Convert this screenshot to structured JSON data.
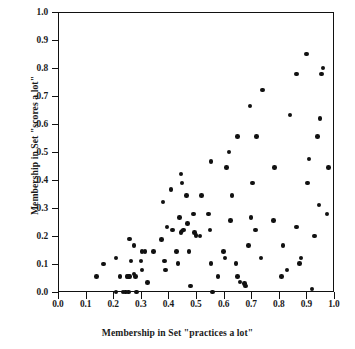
{
  "chart_data": {
    "type": "scatter",
    "title": "",
    "xlabel": "Membership in Set \"practices a lot\"",
    "ylabel": "Membership in Set \"scores a lot\"",
    "xlim": [
      0.0,
      1.0
    ],
    "ylim": [
      0.0,
      1.0
    ],
    "grid": false,
    "legend": null,
    "marker": {
      "shape": "circle",
      "color": "#111111",
      "size": 4.6
    },
    "xticks": [
      "0.0",
      "0.1",
      "0.2",
      "0.3",
      "0.4",
      "0.5",
      "0.6",
      "0.7",
      "0.8",
      "0.9",
      "1.0"
    ],
    "yticks": [
      "0.0",
      "0.1",
      "0.2",
      "0.3",
      "0.4",
      "0.5",
      "0.6",
      "0.7",
      "0.8",
      "0.9",
      "1.0"
    ],
    "xtick_values": [
      0.0,
      0.1,
      0.2,
      0.3,
      0.4,
      0.5,
      0.6,
      0.7,
      0.8,
      0.9,
      1.0
    ],
    "ytick_values": [
      0.0,
      0.1,
      0.2,
      0.3,
      0.4,
      0.5,
      0.6,
      0.7,
      0.8,
      0.9,
      1.0
    ],
    "n_points": 108,
    "points": [
      [
        0.14,
        0.055
      ],
      [
        0.165,
        0.1
      ],
      [
        0.21,
        0.0
      ],
      [
        0.21,
        0.122
      ],
      [
        0.225,
        0.055
      ],
      [
        0.235,
        0.0
      ],
      [
        0.245,
        0.0
      ],
      [
        0.25,
        0.055
      ],
      [
        0.255,
        0.055
      ],
      [
        0.255,
        0.0
      ],
      [
        0.26,
        0.055
      ],
      [
        0.26,
        0.19
      ],
      [
        0.265,
        0.111
      ],
      [
        0.275,
        0.167
      ],
      [
        0.275,
        0.065
      ],
      [
        0.28,
        0.055
      ],
      [
        0.285,
        0.0
      ],
      [
        0.3,
        0.111
      ],
      [
        0.305,
        0.145
      ],
      [
        0.305,
        0.078
      ],
      [
        0.315,
        0.145
      ],
      [
        0.325,
        0.033
      ],
      [
        0.345,
        0.145
      ],
      [
        0.375,
        0.188
      ],
      [
        0.38,
        0.322
      ],
      [
        0.385,
        0.111
      ],
      [
        0.39,
        0.078
      ],
      [
        0.395,
        0.232
      ],
      [
        0.41,
        0.367
      ],
      [
        0.415,
        0.222
      ],
      [
        0.43,
        0.145
      ],
      [
        0.435,
        0.101
      ],
      [
        0.44,
        0.267
      ],
      [
        0.445,
        0.422
      ],
      [
        0.445,
        0.212
      ],
      [
        0.45,
        0.39
      ],
      [
        0.45,
        0.218
      ],
      [
        0.455,
        0.222
      ],
      [
        0.465,
        0.345
      ],
      [
        0.47,
        0.244
      ],
      [
        0.475,
        0.145
      ],
      [
        0.48,
        0.022
      ],
      [
        0.49,
        0.278
      ],
      [
        0.495,
        0.212
      ],
      [
        0.5,
        0.202
      ],
      [
        0.515,
        0.2
      ],
      [
        0.52,
        0.345
      ],
      [
        0.545,
        0.278
      ],
      [
        0.55,
        0.222
      ],
      [
        0.555,
        0.101
      ],
      [
        0.555,
        0.467
      ],
      [
        0.56,
        0.0
      ],
      [
        0.58,
        0.055
      ],
      [
        0.6,
        0.145
      ],
      [
        0.605,
        0.122
      ],
      [
        0.61,
        0.444
      ],
      [
        0.62,
        0.5
      ],
      [
        0.625,
        0.256
      ],
      [
        0.63,
        0.345
      ],
      [
        0.645,
        0.101
      ],
      [
        0.65,
        0.055
      ],
      [
        0.65,
        0.555
      ],
      [
        0.66,
        0.035
      ],
      [
        0.675,
        0.03
      ],
      [
        0.68,
        0.022
      ],
      [
        0.69,
        0.167
      ],
      [
        0.695,
        0.665
      ],
      [
        0.7,
        0.267
      ],
      [
        0.705,
        0.39
      ],
      [
        0.715,
        0.222
      ],
      [
        0.72,
        0.555
      ],
      [
        0.735,
        0.122
      ],
      [
        0.74,
        0.722
      ],
      [
        0.78,
        0.256
      ],
      [
        0.785,
        0.444
      ],
      [
        0.81,
        0.055
      ],
      [
        0.815,
        0.167
      ],
      [
        0.83,
        0.078
      ],
      [
        0.84,
        0.632
      ],
      [
        0.865,
        0.232
      ],
      [
        0.865,
        0.778
      ],
      [
        0.875,
        0.101
      ],
      [
        0.88,
        0.122
      ],
      [
        0.9,
        0.85
      ],
      [
        0.905,
        0.39
      ],
      [
        0.91,
        0.475
      ],
      [
        0.92,
        0.011
      ],
      [
        0.93,
        0.2
      ],
      [
        0.94,
        0.555
      ],
      [
        0.945,
        0.31
      ],
      [
        0.95,
        0.62
      ],
      [
        0.955,
        0.778
      ],
      [
        0.96,
        0.8
      ],
      [
        0.975,
        0.278
      ],
      [
        0.98,
        0.445
      ]
    ]
  }
}
